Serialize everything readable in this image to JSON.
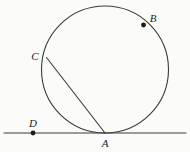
{
  "figure": {
    "kind": "geometry-diagram",
    "width": 190,
    "height": 152,
    "background_color": "#fbfbf9",
    "stroke_color": "#3a3a3a",
    "label_color": "#1b1b1b",
    "stroke_width": 1.1
  },
  "circle": {
    "name": "main-circle",
    "center_x": 105,
    "center_y": 69.5,
    "radius": 63.5
  },
  "tangent_line": {
    "name": "tangent-line",
    "x1": 4,
    "y1": 133,
    "x2": 186,
    "y2": 133
  },
  "chord": {
    "name": "chord-c-a",
    "x1": 46.5,
    "y1": 57.5,
    "x2": 105,
    "y2": 133
  },
  "points": [
    {
      "id": "A",
      "label": "A",
      "dot": false,
      "x": 105,
      "y": 133,
      "label_x": 105,
      "label_y": 143,
      "role": "tangency-point"
    },
    {
      "id": "B",
      "label": "B",
      "dot": true,
      "x": 143.5,
      "y": 25,
      "label_x": 153,
      "label_y": 18,
      "role": "point-on-circle"
    },
    {
      "id": "C",
      "label": "C",
      "dot": false,
      "x": 46.5,
      "y": 57.5,
      "label_x": 35,
      "label_y": 56,
      "role": "point-on-circle"
    },
    {
      "id": "D",
      "label": "D",
      "dot": true,
      "x": 33,
      "y": 133,
      "label_x": 33,
      "label_y": 123,
      "role": "point-on-line"
    }
  ],
  "dot_radius": 2.4
}
